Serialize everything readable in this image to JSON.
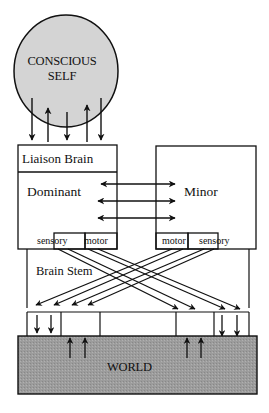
{
  "diagram": {
    "type": "brain-mind interaction schematic",
    "nodes": {
      "conscious_self": {
        "label_line1": "CONSCIOUS",
        "label_line2": "SELF",
        "shape": "circle",
        "fill": "#d4d4d4"
      },
      "liaison_brain": {
        "label": "Liaison Brain"
      },
      "dominant": {
        "label": "Dominant"
      },
      "minor": {
        "label": "Minor"
      },
      "dominant_sensory": {
        "label": "sensory"
      },
      "dominant_motor": {
        "label": "motor"
      },
      "minor_motor": {
        "label": "motor"
      },
      "minor_sensory": {
        "label": "sensory"
      },
      "brain_stem": {
        "label": "Brain Stem"
      },
      "world": {
        "label": "WORLD",
        "fill": "#9a9a9a"
      }
    },
    "edges": [
      {
        "from": "conscious_self",
        "to": "liaison_brain",
        "count": 3,
        "direction": "down"
      },
      {
        "from": "liaison_brain",
        "to": "conscious_self",
        "count": 2,
        "direction": "up"
      },
      {
        "from": "dominant",
        "to": "minor",
        "count": 3,
        "direction": "bidirectional"
      },
      {
        "from": "dominant_motor",
        "to": "right_periphery",
        "count": 3,
        "direction": "crossed"
      },
      {
        "from": "minor_motor",
        "to": "left_periphery",
        "count": 3,
        "direction": "crossed"
      },
      {
        "from": "world",
        "to": "brain_stem",
        "count": 4,
        "direction": "up"
      },
      {
        "from": "brain_stem",
        "to": "world",
        "count": 4,
        "direction": "down"
      }
    ]
  }
}
